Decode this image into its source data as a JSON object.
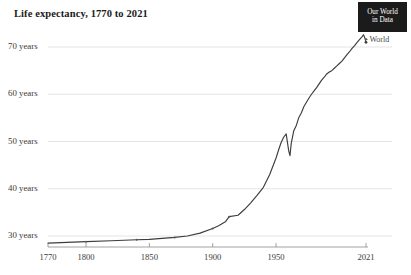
{
  "header": {
    "title": "Life expectancy, 1770 to 2021",
    "logo_line1": "Our World",
    "logo_line2": "in Data"
  },
  "chart_data": {
    "type": "line",
    "title": "Life expectancy, 1770 to 2021",
    "xlabel": "",
    "ylabel": "",
    "xlim": [
      1770,
      2021
    ],
    "ylim": [
      27.5,
      74
    ],
    "grid": true,
    "legend_position": "right-endpoint",
    "x_ticks": [
      1770,
      1800,
      1850,
      1900,
      1950,
      2021
    ],
    "x_tick_labels": [
      "1770",
      "1800",
      "1850",
      "1900",
      "1950",
      "2021"
    ],
    "y_ticks": [
      30,
      40,
      50,
      60,
      70
    ],
    "y_tick_labels": [
      "30 years",
      "40 years",
      "50 years",
      "60 years",
      "70 years"
    ],
    "series": [
      {
        "name": "World",
        "color": "#3d3d3d",
        "end_label": "World",
        "x": [
          1770,
          1800,
          1820,
          1840,
          1850,
          1860,
          1870,
          1880,
          1890,
          1900,
          1905,
          1910,
          1913,
          1920,
          1925,
          1930,
          1935,
          1940,
          1945,
          1950,
          1952,
          1954,
          1956,
          1958,
          1960,
          1961,
          1962,
          1964,
          1966,
          1968,
          1970,
          1972,
          1974,
          1976,
          1978,
          1980,
          1982,
          1984,
          1986,
          1988,
          1990,
          1992,
          1994,
          1996,
          1998,
          2000,
          2002,
          2004,
          2006,
          2008,
          2010,
          2012,
          2014,
          2016,
          2018,
          2019,
          2020,
          2021
        ],
        "y": [
          28.5,
          28.8,
          29.0,
          29.2,
          29.3,
          29.5,
          29.7,
          30.0,
          30.6,
          31.6,
          32.2,
          33.0,
          34.1,
          34.4,
          35.6,
          37.0,
          38.6,
          40.3,
          43.0,
          46.5,
          48.2,
          49.8,
          50.9,
          51.6,
          48.0,
          47.0,
          49.6,
          52.3,
          53.4,
          55.1,
          56.1,
          57.4,
          58.3,
          59.2,
          60.0,
          60.7,
          61.4,
          62.2,
          63.0,
          63.6,
          64.3,
          64.7,
          65.0,
          65.5,
          66.0,
          66.5,
          67.0,
          67.7,
          68.4,
          69.0,
          69.7,
          70.3,
          71.0,
          71.6,
          72.2,
          72.6,
          72.0,
          71.0
        ]
      }
    ],
    "annotations": [
      {
        "text": "World",
        "x": 2021,
        "y": 72.6,
        "kind": "series-end-label"
      }
    ]
  }
}
